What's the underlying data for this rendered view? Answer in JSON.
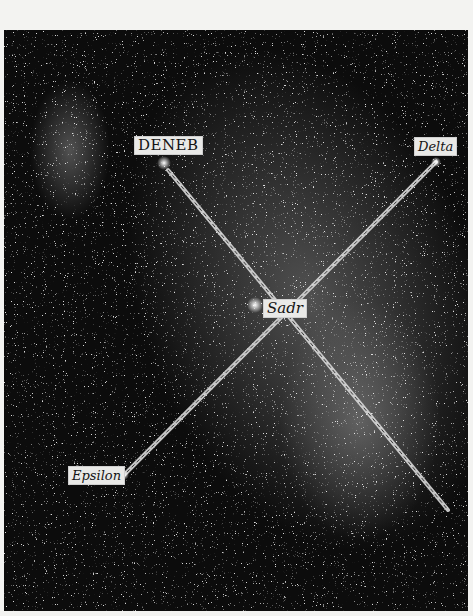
{
  "image": {
    "subject": "star field photograph with labeled stars connected by lines",
    "colors": {
      "sky": "#0c0c0c",
      "label_bg": "#e9e9e7",
      "label_text": "#141414",
      "line": "#d8d8d8",
      "border": "#f3f3f1"
    }
  },
  "labels": {
    "deneb": "DENEB",
    "delta": "Delta",
    "sadr": "Sadr",
    "epsilon": "Epsilon"
  },
  "stars": [
    {
      "name": "Deneb",
      "x": 164,
      "y": 163
    },
    {
      "name": "Delta",
      "x": 436,
      "y": 162
    },
    {
      "name": "Sadr",
      "x": 255,
      "y": 305
    },
    {
      "name": "Epsilon",
      "x": 124,
      "y": 475
    },
    {
      "name": "end",
      "x": 448,
      "y": 510
    }
  ]
}
